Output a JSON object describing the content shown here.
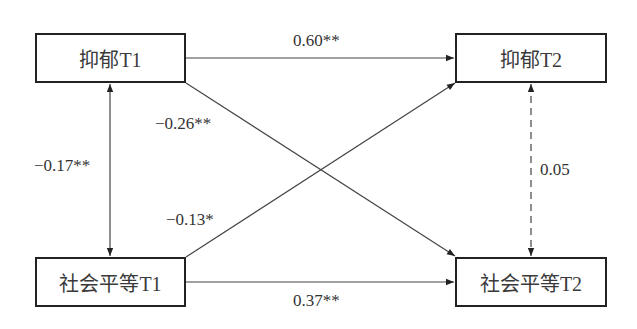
{
  "diagram": {
    "type": "cross-lagged path model",
    "nodes": [
      {
        "id": "dep_t1",
        "label": "抑郁T1"
      },
      {
        "id": "dep_t2",
        "label": "抑郁T2"
      },
      {
        "id": "soc_t1",
        "label": "社会平等T1"
      },
      {
        "id": "soc_t2",
        "label": "社会平等T2"
      }
    ],
    "edges": [
      {
        "from": "dep_t1",
        "to": "dep_t2",
        "label": "0.60**",
        "style": "solid",
        "direction": "forward"
      },
      {
        "from": "dep_t1",
        "to": "soc_t2",
        "label": "−0.26**",
        "style": "solid",
        "direction": "forward"
      },
      {
        "from": "dep_t1",
        "to": "soc_t1",
        "label": "−0.17**",
        "style": "solid",
        "direction": "both"
      },
      {
        "from": "soc_t1",
        "to": "dep_t2",
        "label": "−0.13*",
        "style": "solid",
        "direction": "forward"
      },
      {
        "from": "dep_t2",
        "to": "soc_t2",
        "label": "0.05",
        "style": "dashed",
        "direction": "both"
      },
      {
        "from": "soc_t1",
        "to": "soc_t2",
        "label": "0.37**",
        "style": "solid",
        "direction": "forward"
      }
    ]
  }
}
